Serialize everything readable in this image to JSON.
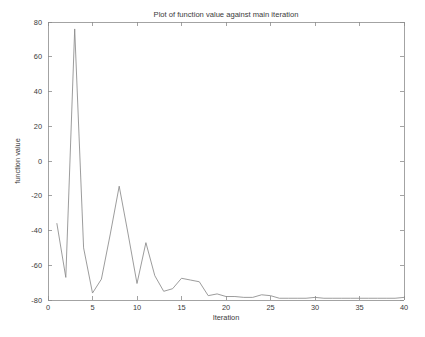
{
  "chart_data": {
    "type": "line",
    "title": "Plot of function value against main iteration",
    "xlabel": "Iteration",
    "ylabel": "function value",
    "xlim": [
      0,
      40
    ],
    "ylim": [
      -80,
      80
    ],
    "xticks": [
      0,
      5,
      10,
      15,
      20,
      25,
      30,
      35,
      40
    ],
    "yticks": [
      -80,
      -60,
      -40,
      -20,
      0,
      20,
      40,
      60,
      80
    ],
    "xtick_labels": [
      "0",
      "5",
      "10",
      "15",
      "20",
      "25",
      "30",
      "35",
      "40"
    ],
    "ytick_labels": [
      "-80",
      "-60",
      "-40",
      "-20",
      "0",
      "20",
      "40",
      "60",
      "80"
    ],
    "grid": false,
    "legend": null,
    "line_color": "#8a8a8a",
    "background_color": "#ffffff",
    "axis_color": "#8c8c8c",
    "series": [
      {
        "name": "function value",
        "x": [
          1,
          2,
          3,
          4,
          5,
          6,
          7,
          8,
          9,
          10,
          11,
          12,
          13,
          14,
          15,
          16,
          17,
          18,
          19,
          20,
          21,
          22,
          23,
          24,
          25,
          26,
          27,
          28,
          29,
          30,
          31,
          32,
          33,
          34,
          35,
          36,
          37,
          38,
          39,
          40
        ],
        "y": [
          -36,
          -67,
          76,
          -50,
          -76,
          -68,
          -42,
          -14.5,
          -42,
          -70.5,
          -47,
          -66,
          -75,
          -73.5,
          -67.5,
          -68.5,
          -69.5,
          -77.5,
          -76.5,
          -78,
          -78,
          -78.5,
          -78.5,
          -77,
          -77.5,
          -79,
          -79,
          -79,
          -79,
          -78.5,
          -79,
          -79,
          -79,
          -79,
          -79,
          -79,
          -79,
          -79,
          -79,
          -78.5
        ]
      }
    ]
  },
  "plot_geometry": {
    "left": 48,
    "right": 404,
    "top": 22,
    "bottom": 300
  }
}
